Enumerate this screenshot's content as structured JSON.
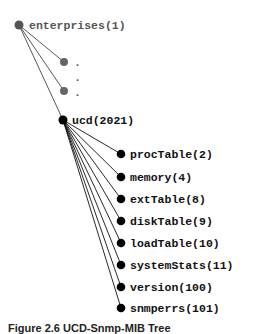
{
  "diagram": {
    "type": "tree",
    "root": {
      "label": "enterprises(1)",
      "color": "#555555"
    },
    "ellipsis_nodes": [
      {
        "label": ".",
        "color": "#666666"
      },
      {
        "label": ".",
        "color": "#666666"
      }
    ],
    "ellipsis_middle": ".",
    "branch": {
      "label": "ucd(2021)",
      "color": "#000000"
    },
    "children": [
      {
        "label": "procTable(2)"
      },
      {
        "label": "memory(4)"
      },
      {
        "label": "extTable(8)"
      },
      {
        "label": "diskTable(9)"
      },
      {
        "label": "loadTable(10)"
      },
      {
        "label": "systemStats(11)"
      },
      {
        "label": "version(100)"
      },
      {
        "label": "snmperrs(101)"
      }
    ],
    "caption": "Figure 2.6 UCD-Snmp-MIB Tree"
  }
}
